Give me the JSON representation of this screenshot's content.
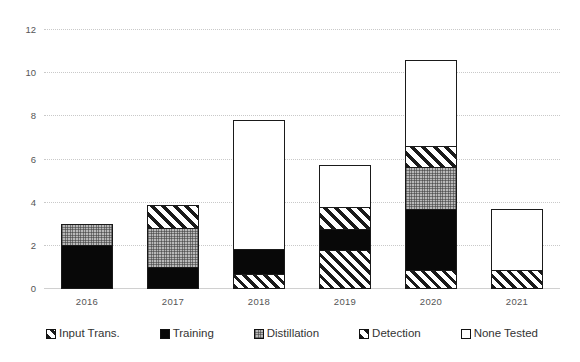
{
  "chart_data": {
    "type": "bar",
    "stacked": true,
    "title": "",
    "xlabel": "",
    "ylabel": "",
    "ylim": [
      0,
      12
    ],
    "yticks": [
      0,
      2,
      4,
      6,
      8,
      10,
      12
    ],
    "grid": true,
    "legend_position": "bottom",
    "categories": [
      "2016",
      "2017",
      "2018",
      "2019",
      "2020",
      "2021"
    ],
    "series": [
      {
        "name": "Input Trans.",
        "pattern": "diagonal-hatch",
        "values": [
          0,
          0,
          0.7,
          1.8,
          0.85,
          0.85
        ]
      },
      {
        "name": "Training",
        "pattern": "solid-black",
        "values": [
          2.0,
          1.0,
          1.15,
          1.0,
          2.85,
          0
        ]
      },
      {
        "name": "Distillation",
        "pattern": "gray-dotted",
        "values": [
          1.0,
          1.85,
          0,
          0,
          2.0,
          0
        ]
      },
      {
        "name": "Detection",
        "pattern": "diagonal-hatch-wide",
        "values": [
          0,
          1.1,
          0,
          1.05,
          1.0,
          0
        ]
      },
      {
        "name": "None Tested",
        "pattern": "white-empty",
        "values": [
          0,
          0,
          6.0,
          1.95,
          4.0,
          2.85
        ]
      }
    ],
    "totals": [
      3.0,
      3.95,
      7.85,
      5.8,
      10.7,
      3.7
    ]
  },
  "legend": {
    "items": [
      {
        "label": "Input Trans.",
        "swatch": "diagonal-hatch"
      },
      {
        "label": "Training",
        "swatch": "solid-black"
      },
      {
        "label": "Distillation",
        "swatch": "gray-dotted"
      },
      {
        "label": "Detection",
        "swatch": "diagonal-hatch-wide"
      },
      {
        "label": "None Tested",
        "swatch": "white-empty"
      }
    ]
  },
  "axis": {
    "y_tick_labels": [
      "12",
      "10",
      "8",
      "6",
      "4",
      "2",
      "0"
    ],
    "x_tick_labels": [
      "2016",
      "2017",
      "2018",
      "2019",
      "2020",
      "2021"
    ]
  },
  "colors": {
    "ink": "#1a1a1a",
    "grid": "#c9c9c9",
    "training": "#080808",
    "distillation": "#b9b9b9",
    "background": "#ffffff"
  }
}
